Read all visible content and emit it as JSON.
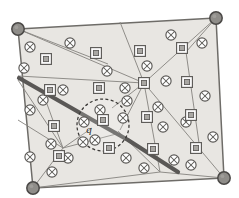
{
  "figure": {
    "kind": "geometry-diagram",
    "canvas": {
      "width": 239,
      "height": 198
    },
    "colors": {
      "background": "#ffffff",
      "region_fill": "#e8e6e2",
      "region_stroke": "#6e6c68",
      "edge_stroke": "#8a8884",
      "highlight_band": "#5a5856",
      "vertex_fill": "#8f8d89",
      "vertex_stroke": "#4a4846",
      "marker_stroke": "#5c5a57",
      "marker_fill": "#a9a7a3",
      "query_circle_stroke": "#3a3836",
      "label_color": "#2b2b2b"
    },
    "labels": {
      "query_point": "q"
    },
    "boundary": {
      "name": "outer-quadrilateral",
      "points": [
        [
          18,
          29
        ],
        [
          216,
          18
        ],
        [
          224,
          178
        ],
        [
          33,
          188
        ]
      ]
    },
    "corner_vertices": [
      {
        "name": "vertex-top-left",
        "x": 18,
        "y": 29,
        "r": 6.5
      },
      {
        "name": "vertex-top-right",
        "x": 216,
        "y": 18,
        "r": 6.5
      },
      {
        "name": "vertex-bottom-right",
        "x": 224,
        "y": 178,
        "r": 6.5
      },
      {
        "name": "vertex-bottom-left",
        "x": 33,
        "y": 188,
        "r": 6.5
      }
    ],
    "hub_vertices": [
      {
        "name": "hub-center-right",
        "x": 144,
        "y": 83
      },
      {
        "name": "hub-bottom-center",
        "x": 160,
        "y": 172
      },
      {
        "name": "hub-left-mid",
        "x": 18,
        "y": 80
      },
      {
        "name": "hub-inner-left",
        "x": 63,
        "y": 148
      }
    ],
    "edges": [
      {
        "name": "edge-tl-to-hub",
        "from": [
          18,
          29
        ],
        "to": [
          144,
          83
        ]
      },
      {
        "name": "edge-tl-to-upper-mid",
        "from": [
          18,
          29
        ],
        "to": [
          108,
          64
        ]
      },
      {
        "name": "edge-upper-chord",
        "from": [
          18,
          76
        ],
        "to": [
          144,
          83
        ]
      },
      {
        "name": "edge-hub-to-tr",
        "from": [
          144,
          83
        ],
        "to": [
          216,
          18
        ]
      },
      {
        "name": "edge-hub-to-top",
        "from": [
          144,
          83
        ],
        "to": [
          120,
          22
        ]
      },
      {
        "name": "edge-hub-to-right",
        "from": [
          144,
          83
        ],
        "to": [
          224,
          178
        ]
      },
      {
        "name": "edge-hub-to-bottomhub",
        "from": [
          144,
          83
        ],
        "to": [
          160,
          172
        ]
      },
      {
        "name": "edge-hub-down-left",
        "from": [
          144,
          83
        ],
        "to": [
          120,
          130
        ]
      },
      {
        "name": "edge-hub-to-circle",
        "from": [
          144,
          83
        ],
        "to": [
          112,
          108
        ]
      },
      {
        "name": "edge-bottomhub-to-br",
        "from": [
          160,
          172
        ],
        "to": [
          224,
          178
        ]
      },
      {
        "name": "edge-bottomhub-to-bl",
        "from": [
          160,
          172
        ],
        "to": [
          33,
          188
        ]
      },
      {
        "name": "edge-bottomhub-up-left",
        "from": [
          160,
          172
        ],
        "to": [
          118,
          131
        ]
      },
      {
        "name": "edge-left-to-innerleft",
        "from": [
          18,
          80
        ],
        "to": [
          63,
          148
        ]
      },
      {
        "name": "edge-innerleft-to-bl",
        "from": [
          63,
          148
        ],
        "to": [
          33,
          188
        ]
      },
      {
        "name": "edge-innerleft-to-circle",
        "from": [
          63,
          148
        ],
        "to": [
          92,
          128
        ]
      },
      {
        "name": "edge-innerleft-to-right",
        "from": [
          63,
          148
        ],
        "to": [
          120,
          133
        ]
      },
      {
        "name": "edge-innerleft-up",
        "from": [
          63,
          148
        ],
        "to": [
          47,
          104
        ]
      },
      {
        "name": "edge-left-lower-chord",
        "from": [
          18,
          120
        ],
        "to": [
          63,
          148
        ]
      },
      {
        "name": "edge-right-vertical",
        "from": [
          186,
          52
        ],
        "to": [
          200,
          150
        ]
      },
      {
        "name": "edge-tr-down",
        "from": [
          216,
          18
        ],
        "to": [
          186,
          52
        ]
      }
    ],
    "highlight_band": {
      "name": "highlighted-path",
      "points": [
        [
          19,
          78
        ],
        [
          96,
          122
        ],
        [
          128,
          140
        ],
        [
          178,
          172
        ]
      ],
      "width": 4.2
    },
    "query_circle": {
      "name": "query-disk",
      "cx": 103,
      "cy": 125,
      "r": 26,
      "dash": "3 2.4"
    },
    "circle_x_markers": [
      {
        "x": 30,
        "y": 47
      },
      {
        "x": 24,
        "y": 68
      },
      {
        "x": 70,
        "y": 43
      },
      {
        "x": 107,
        "y": 71
      },
      {
        "x": 147,
        "y": 66
      },
      {
        "x": 171,
        "y": 35
      },
      {
        "x": 202,
        "y": 43
      },
      {
        "x": 166,
        "y": 81
      },
      {
        "x": 63,
        "y": 90
      },
      {
        "x": 43,
        "y": 100
      },
      {
        "x": 125,
        "y": 88
      },
      {
        "x": 127,
        "y": 101
      },
      {
        "x": 158,
        "y": 107
      },
      {
        "x": 163,
        "y": 127
      },
      {
        "x": 30,
        "y": 110
      },
      {
        "x": 100,
        "y": 110
      },
      {
        "x": 123,
        "y": 118
      },
      {
        "x": 84,
        "y": 122
      },
      {
        "x": 95,
        "y": 140
      },
      {
        "x": 83,
        "y": 142
      },
      {
        "x": 51,
        "y": 144
      },
      {
        "x": 30,
        "y": 157
      },
      {
        "x": 68,
        "y": 158
      },
      {
        "x": 52,
        "y": 172
      },
      {
        "x": 126,
        "y": 158
      },
      {
        "x": 144,
        "y": 168
      },
      {
        "x": 174,
        "y": 160
      },
      {
        "x": 191,
        "y": 165
      },
      {
        "x": 213,
        "y": 137
      },
      {
        "x": 186,
        "y": 122
      },
      {
        "x": 205,
        "y": 96
      }
    ],
    "square_markers": [
      {
        "x": 46,
        "y": 59
      },
      {
        "x": 96,
        "y": 53
      },
      {
        "x": 140,
        "y": 51
      },
      {
        "x": 182,
        "y": 48
      },
      {
        "x": 50,
        "y": 90
      },
      {
        "x": 99,
        "y": 88
      },
      {
        "x": 144,
        "y": 83
      },
      {
        "x": 187,
        "y": 82
      },
      {
        "x": 103,
        "y": 120
      },
      {
        "x": 147,
        "y": 117
      },
      {
        "x": 191,
        "y": 115
      },
      {
        "x": 54,
        "y": 126
      },
      {
        "x": 109,
        "y": 148
      },
      {
        "x": 153,
        "y": 149
      },
      {
        "x": 196,
        "y": 148
      },
      {
        "x": 59,
        "y": 156
      }
    ]
  }
}
